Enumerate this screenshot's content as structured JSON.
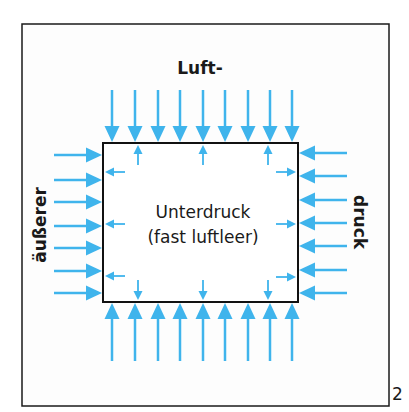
{
  "figure": {
    "number": "2",
    "labels": {
      "top": "Luft-",
      "left": "äußerer",
      "right": "druck",
      "inner_line1": "Unterdruck",
      "inner_line2": "(fast luftleer)"
    },
    "colors": {
      "arrow": "#3fb4ec",
      "frame": "#1a1a1a",
      "background": "#fdfdfd"
    },
    "outer_frame": {
      "x": 22,
      "y": 24,
      "w": 367,
      "h": 382
    },
    "container": {
      "x": 103,
      "y": 143,
      "w": 195,
      "h": 159
    },
    "outer_arrows": {
      "top_x": [
        112,
        135,
        158,
        180,
        203,
        225,
        248,
        270,
        292
      ],
      "bottom_x": [
        112,
        135,
        158,
        180,
        203,
        225,
        248,
        270,
        292
      ],
      "left_y": [
        155,
        180,
        202,
        226,
        248,
        271,
        293
      ],
      "right_y": [
        153,
        176,
        200,
        223,
        246,
        270,
        293
      ],
      "length": 52
    },
    "inner_arrows": {
      "top_x": [
        138,
        203,
        268
      ],
      "bottom_x": [
        138,
        203,
        268
      ],
      "left_y": [
        172,
        224,
        276
      ],
      "right_y": [
        172,
        224,
        277
      ],
      "length": 20
    },
    "caption": "Outside air pressure pushes in on all sides of a nearly evacuated box (underpressure inside)."
  }
}
